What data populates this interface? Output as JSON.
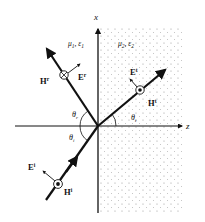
{
  "diagram": {
    "type": "oblique incidence at planar interface",
    "axes": {
      "vertical_label": "x",
      "horizontal_label": "z"
    },
    "media": {
      "medium1": {
        "label": "μ1, ε1",
        "mu": "μ",
        "mu_sub": "1",
        "eps": "ε",
        "eps_sub": "1"
      },
      "medium2": {
        "label": "μ2, ε2",
        "mu": "μ",
        "mu_sub": "2",
        "eps": "ε",
        "eps_sub": "2",
        "fill": "dotted"
      }
    },
    "waves": {
      "incident": {
        "E": "E",
        "E_sup": "i",
        "H": "H",
        "H_sup": "i",
        "H_symbol": "out-of-page dot"
      },
      "reflected": {
        "E": "E",
        "E_sup": "r",
        "H": "H",
        "H_sup": "r",
        "H_symbol": "into-page cross"
      },
      "transmitted": {
        "E": "E",
        "E_sup": "t",
        "H": "H",
        "H_sup": "t",
        "H_symbol": "out-of-page dot"
      }
    },
    "angles": {
      "incidence": {
        "symbol": "θ",
        "sub": "i"
      },
      "reflection": {
        "symbol": "θ",
        "sub": "r"
      },
      "transmission": {
        "symbol": "θ",
        "sub": "t"
      }
    },
    "colors": {
      "line": "#111111",
      "dots": "#9a9a9a",
      "background": "#ffffff"
    }
  }
}
